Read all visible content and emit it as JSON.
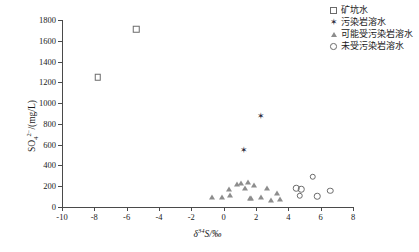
{
  "chart_data": {
    "type": "scatter",
    "title": "",
    "xlabel": "δ³⁴S/‰",
    "ylabel": "SO₄²⁻/(mg/L)",
    "xlim": [
      -10,
      8
    ],
    "ylim": [
      0,
      1800
    ],
    "xticks": [
      -10,
      -8,
      -6,
      -4,
      -2,
      0,
      2,
      4,
      6,
      8
    ],
    "xtick_labels": [
      "-10",
      "-8",
      "-6",
      "-4",
      "-2",
      "0",
      "2",
      "4",
      "6",
      "8"
    ],
    "yticks": [
      0,
      200,
      400,
      600,
      800,
      1000,
      1200,
      1400,
      1600,
      1800
    ],
    "ytick_labels": [
      "0",
      "200",
      "400",
      "600",
      "800",
      "1000",
      "1200",
      "1400",
      "1600",
      "1800"
    ],
    "grid": false,
    "legend_position": "top-right",
    "series": [
      {
        "name": "矿坑水",
        "marker": "square-open",
        "color": "#6b6b6b",
        "points": [
          {
            "x": -7.8,
            "y": 1250
          },
          {
            "x": -5.4,
            "y": 1710
          }
        ]
      },
      {
        "name": "污染岩溶水",
        "marker": "star",
        "color": "#2b2b3a",
        "points": [
          {
            "x": 1.2,
            "y": 545
          },
          {
            "x": 2.3,
            "y": 875
          }
        ]
      },
      {
        "name": "可能受污染岩溶水",
        "marker": "triangle-open",
        "color": "#8d8d8d",
        "points": [
          {
            "x": -0.7,
            "y": 95
          },
          {
            "x": -0.1,
            "y": 100
          },
          {
            "x": 0.3,
            "y": 175
          },
          {
            "x": 0.4,
            "y": 120
          },
          {
            "x": 0.8,
            "y": 225
          },
          {
            "x": 1.1,
            "y": 235
          },
          {
            "x": 1.3,
            "y": 180
          },
          {
            "x": 1.5,
            "y": 240
          },
          {
            "x": 1.6,
            "y": 90
          },
          {
            "x": 1.7,
            "y": 85
          },
          {
            "x": 1.9,
            "y": 215
          },
          {
            "x": 2.3,
            "y": 95
          },
          {
            "x": 2.7,
            "y": 185
          },
          {
            "x": 2.9,
            "y": 70
          },
          {
            "x": 3.3,
            "y": 130
          },
          {
            "x": 3.5,
            "y": 80
          }
        ]
      },
      {
        "name": "未受污染岩溶水",
        "marker": "circle-open",
        "color": "#6b6b6b",
        "points": [
          {
            "x": 4.5,
            "y": 180
          },
          {
            "x": 4.8,
            "y": 170
          },
          {
            "x": 4.7,
            "y": 110
          },
          {
            "x": 5.5,
            "y": 290
          },
          {
            "x": 5.8,
            "y": 105
          },
          {
            "x": 6.6,
            "y": 155
          }
        ]
      }
    ]
  },
  "legend": {
    "items": [
      {
        "label": "矿坑水",
        "marker": "square-open"
      },
      {
        "label": "污染岩溶水",
        "marker": "star"
      },
      {
        "label": "可能受污染岩溶水",
        "marker": "triangle-open"
      },
      {
        "label": "未受污染岩溶水",
        "marker": "circle-open"
      }
    ]
  },
  "axis_titles": {
    "y_main": "SO",
    "y_sub": "4",
    "y_sup": "2−",
    "y_unit": "/(mg/L)",
    "x_delta": "δ",
    "x_sup": "34",
    "x_elem": "S",
    "x_unit": "/‰"
  }
}
